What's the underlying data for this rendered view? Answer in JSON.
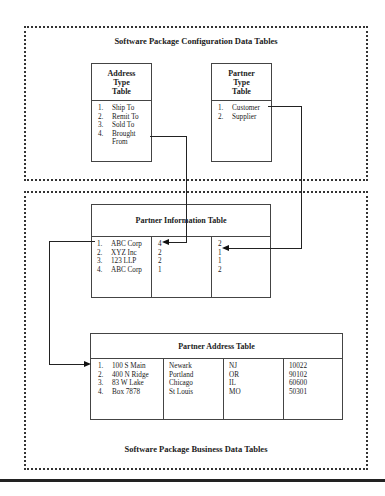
{
  "config_section": {
    "title": "Software Package Configuration Data Tables",
    "address_type_table": {
      "header": [
        "Address",
        "Type",
        "Table"
      ],
      "rows": [
        {
          "n": "1.",
          "label": "Ship To"
        },
        {
          "n": "2.",
          "label": "Remit To"
        },
        {
          "n": "3.",
          "label": "Sold To"
        },
        {
          "n": "4.",
          "label": "Brought"
        },
        {
          "n": "",
          "label": "From"
        }
      ]
    },
    "partner_type_table": {
      "header": [
        "Partner",
        "Type",
        "Table"
      ],
      "rows": [
        {
          "n": "1.",
          "label": "Customer"
        },
        {
          "n": "2.",
          "label": "Supplier"
        }
      ]
    }
  },
  "business_section": {
    "title": "Software Package Business Data Tables",
    "partner_information_table": {
      "header": "Partner Information Table",
      "names": [
        {
          "n": "1.",
          "label": "ABC Corp"
        },
        {
          "n": "2.",
          "label": "XYZ Inc"
        },
        {
          "n": "3.",
          "label": "123 LLP"
        },
        {
          "n": "4.",
          "label": "ABC Corp"
        }
      ],
      "address_type_ids": [
        "4",
        "2",
        "2",
        "1"
      ],
      "partner_type_ids": [
        "2",
        "1",
        "1",
        "2"
      ]
    },
    "partner_address_table": {
      "header": "Partner Address Table",
      "streets": [
        {
          "n": "1.",
          "label": "100 S Main"
        },
        {
          "n": "2.",
          "label": "400 N Ridge"
        },
        {
          "n": "3.",
          "label": "83 W Lake"
        },
        {
          "n": "4.",
          "label": "Box 7878"
        }
      ],
      "cities": [
        "Newark",
        "Portland",
        "Chicago",
        "St Louis"
      ],
      "states": [
        "NJ",
        "OR",
        "IL",
        "MO"
      ],
      "zips": [
        "10022",
        "90102",
        "60600",
        "50301"
      ]
    }
  }
}
